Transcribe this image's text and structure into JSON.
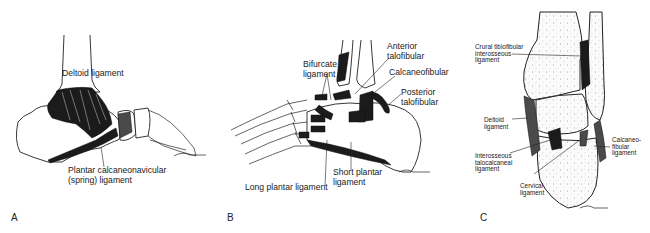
{
  "figure": {
    "panels": [
      {
        "letter": "A",
        "view": "medial ankle",
        "labels": [
          "Deltoid ligament",
          "Plantar calcaneonavicular\n(spring) ligament"
        ]
      },
      {
        "letter": "B",
        "view": "lateral ankle",
        "labels": [
          "Bifurcate\nligament",
          "Anterior\ntalofibular",
          "Calcaneofibular",
          "Posterior\ntalofibular",
          "Long plantar ligament",
          "Short plantar\nligament"
        ]
      },
      {
        "letter": "C",
        "view": "coronal section",
        "labels": [
          "Crural tibiofibular\ninterosseous\nligament",
          "Deltoid\nligament",
          "Calcaneo-\nfibular\nligament",
          "Interosseous\ntalocalcaneal\nligament",
          "Cervical\nligament"
        ]
      }
    ]
  }
}
